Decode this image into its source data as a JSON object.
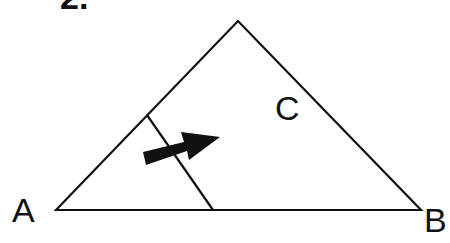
{
  "figure": {
    "number_label": "2.",
    "vertices": {
      "A": {
        "label": "A"
      },
      "B": {
        "label": "B"
      },
      "C": {
        "label": "C"
      }
    },
    "stroke_color": "#111111",
    "arrow_color": "#111111",
    "background": "#ffffff"
  }
}
